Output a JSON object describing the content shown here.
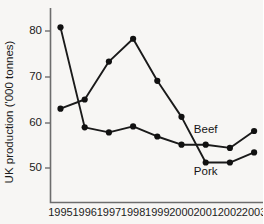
{
  "chart_data": {
    "type": "line",
    "title": "",
    "xlabel": "",
    "ylabel": "UK production ('000 tonnes)",
    "categories": [
      "1995",
      "1996",
      "1997",
      "1998",
      "1999",
      "2000",
      "2001",
      "2002",
      "2003"
    ],
    "x": [
      1995,
      1996,
      1997,
      1998,
      1999,
      2000,
      2001,
      2002,
      2003
    ],
    "ylim": [
      44,
      84
    ],
    "xlim": [
      1994.6,
      2003.6
    ],
    "yticks": [
      50,
      60,
      70,
      80
    ],
    "ytick_labels": [
      "50",
      "60",
      "70",
      "80"
    ],
    "grid": false,
    "legend_position": "inline-annotation",
    "series": [
      {
        "name": "Beef",
        "label": "Beef",
        "color": "#111111",
        "values": [
          80.8,
          58.9,
          57.8,
          59.1,
          56.9,
          55.1,
          55.1,
          54.4,
          58.1
        ]
      },
      {
        "name": "Pork",
        "label": "Pork",
        "color": "#111111",
        "values": [
          63.0,
          65.0,
          73.3,
          78.3,
          69.1,
          61.2,
          51.2,
          51.2,
          53.4
        ]
      }
    ],
    "annotations": [
      {
        "text": "Beef",
        "series": "Beef",
        "x": 2001,
        "y": 57.6
      },
      {
        "text": "Pork",
        "series": "Pork",
        "x": 2001,
        "y": 48.4
      }
    ]
  },
  "axis": {
    "y_title": "UK production ('000 tonnes)",
    "y_tick_labels": [
      "80",
      "70",
      "60",
      "50"
    ],
    "x_tick_labels": [
      "1995",
      "1996",
      "1997",
      "1998",
      "1999",
      "2000",
      "2001",
      "2002",
      "2003"
    ]
  },
  "labels": {
    "beef": "Beef",
    "pork": "Pork"
  }
}
